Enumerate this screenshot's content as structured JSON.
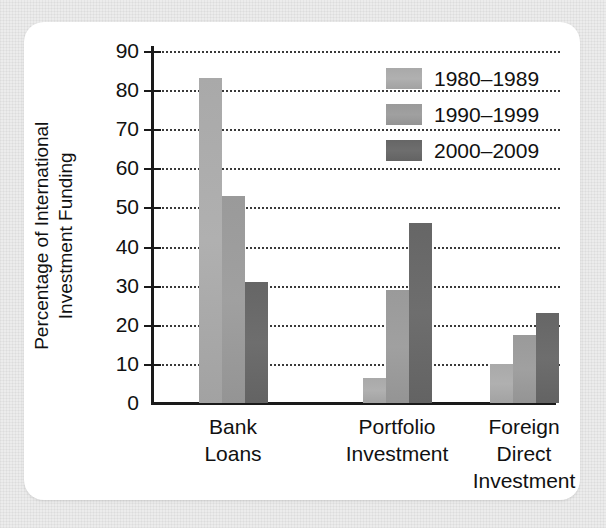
{
  "chart_data": {
    "type": "bar",
    "title": "",
    "xlabel": "",
    "ylabel": "Percentage of International Investment Funding",
    "ylabel_line1": "Percentage of International",
    "ylabel_line2": "Investment Funding",
    "ylim": [
      0,
      90
    ],
    "ytick_step": 10,
    "yticks": [
      90,
      80,
      70,
      60,
      50,
      40,
      30,
      20,
      10,
      0
    ],
    "grid": true,
    "grid_style": "dotted-horizontal",
    "legend_position": "top-right",
    "categories": [
      "Bank Loans",
      "Portfolio Investment",
      "Foreign Direct Investment"
    ],
    "category_lines": [
      [
        "Bank",
        "Loans"
      ],
      [
        "Portfolio",
        "Investment"
      ],
      [
        "Foreign",
        "Direct",
        "Investment"
      ]
    ],
    "series": [
      {
        "name": "1980–1989",
        "color": "#a9a9a9",
        "values": [
          83,
          6.5,
          10
        ]
      },
      {
        "name": "1990–1999",
        "color": "#9a9a9a",
        "values": [
          53,
          29,
          17.5
        ]
      },
      {
        "name": "2000–2009",
        "color": "#666666",
        "values": [
          31,
          46,
          23
        ]
      }
    ]
  }
}
